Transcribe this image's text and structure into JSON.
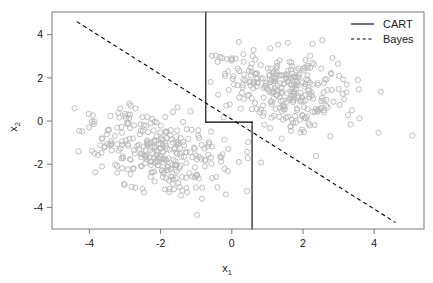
{
  "chart_data": {
    "type": "scatter",
    "title": "",
    "xlabel": "x_1",
    "xlabel_base": "x",
    "xlabel_sub": "1",
    "ylabel": "x_2",
    "ylabel_base": "x",
    "ylabel_sub": "2",
    "xlim": [
      -5.05,
      5.4
    ],
    "ylim": [
      -5.0,
      5.05
    ],
    "xticks": [
      -4,
      -2,
      0,
      2,
      4
    ],
    "xtick_labels": [
      "-4",
      "-2",
      "0",
      "2",
      "4"
    ],
    "yticks": [
      -4,
      -2,
      0,
      2,
      4
    ],
    "ytick_labels": [
      "-4",
      "-2",
      "0",
      "2",
      "4"
    ],
    "grid": false,
    "point_style": {
      "marker": "open-circle",
      "color": "#b8b8b8",
      "radius": 2.6,
      "stroke_width": 0.9,
      "count": 600
    },
    "clusters": [
      {
        "name": "class-1-lower-left",
        "center": [
          -2.0,
          -1.5
        ],
        "n": 300
      },
      {
        "name": "class-2-upper-right",
        "center": [
          1.5,
          1.5
        ],
        "n": 300
      }
    ],
    "boundaries": [
      {
        "name": "CART",
        "style": "solid",
        "color": "#000000",
        "width": 1.1,
        "segments": [
          {
            "type": "vline",
            "x": -0.73,
            "y0": 5.05,
            "y1": -0.05
          },
          {
            "type": "hline",
            "y": -0.05,
            "x0": -0.73,
            "x1": 0.57
          },
          {
            "type": "vline",
            "x": 0.57,
            "y0": -0.05,
            "y1": -5.0
          }
        ]
      },
      {
        "name": "Bayes",
        "style": "dashed",
        "color": "#000000",
        "width": 1.1,
        "line": {
          "from": [
            -4.35,
            4.6
          ],
          "to": [
            4.6,
            -4.7
          ]
        }
      }
    ],
    "legend": {
      "position": "top-right-inside",
      "entries": [
        {
          "label": "CART",
          "style": "solid"
        },
        {
          "label": "Bayes",
          "style": "dashed"
        }
      ]
    },
    "frame": {
      "color": "#7a7a7a",
      "width": 1.0
    }
  },
  "legend": {
    "cart_label": "CART",
    "bayes_label": "Bayes"
  },
  "axes": {
    "x_title_base": "x",
    "x_title_sub": "1",
    "y_title_base": "x",
    "y_title_sub": "2",
    "x_tick_0": "-4",
    "x_tick_1": "-2",
    "x_tick_2": "0",
    "x_tick_3": "2",
    "x_tick_4": "4",
    "y_tick_0": "-4",
    "y_tick_1": "-2",
    "y_tick_2": "0",
    "y_tick_3": "2",
    "y_tick_4": "4"
  }
}
